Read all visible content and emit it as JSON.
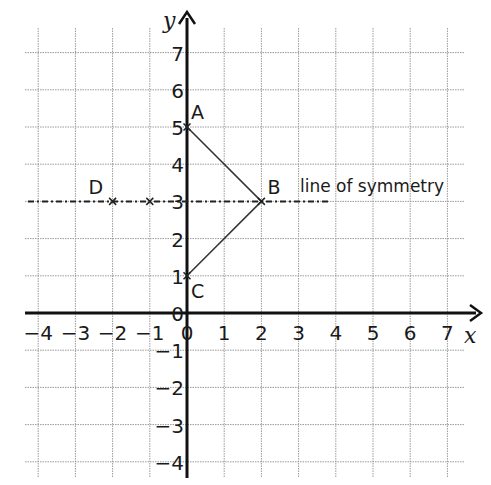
{
  "diagram": {
    "type": "coordinate-grid",
    "axes": {
      "x_label": "x",
      "y_label": "y",
      "x_range": [
        -4,
        7
      ],
      "y_range": [
        -4,
        7
      ],
      "x_ticks": [
        "−4",
        "−3",
        "−2",
        "−1",
        "0",
        "1",
        "2",
        "3",
        "4",
        "5",
        "6",
        "7"
      ],
      "y_ticks": [
        "7",
        "6",
        "5",
        "4",
        "3",
        "2",
        "1",
        "0",
        "−1",
        "−2",
        "−3",
        "−4"
      ]
    },
    "points": [
      {
        "label": "A",
        "x": 0,
        "y": 5
      },
      {
        "label": "B",
        "x": 2,
        "y": 3
      },
      {
        "label": "C",
        "x": 0,
        "y": 1
      },
      {
        "label": "D",
        "x": -2,
        "y": 3
      },
      {
        "label": "",
        "x": -1,
        "y": 3
      }
    ],
    "segments": [
      {
        "from": "A",
        "to": "B"
      },
      {
        "from": "B",
        "to": "C"
      }
    ],
    "line_of_symmetry": {
      "label": "line of symmetry",
      "equation": "y = 3",
      "style": "dashed"
    },
    "colors": {
      "grid": "#9a9a9a",
      "axis": "#111111",
      "shape": "#333333",
      "background": "#ffffff"
    }
  }
}
